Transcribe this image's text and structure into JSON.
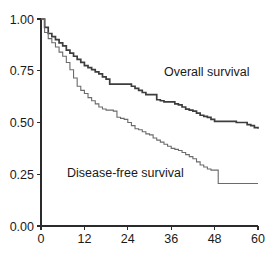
{
  "figure": {
    "background_color": "#ffffff",
    "axis_color": "#2b2b2b",
    "text_color": "#1a1a1a"
  },
  "annotations": {
    "overall_label": "Overall survival",
    "disease_free_label": "Disease-free survival"
  },
  "chart_data": {
    "type": "line",
    "title": "",
    "xlabel": "",
    "ylabel": "",
    "xlim": [
      0,
      60
    ],
    "ylim": [
      0,
      1.0
    ],
    "grid": false,
    "legend": "inline-annotations",
    "xticks": [
      0,
      12,
      24,
      36,
      48,
      60
    ],
    "xticklabels": [
      "0",
      "12",
      "24",
      "36",
      "48",
      "60"
    ],
    "yticks": [
      0.0,
      0.25,
      0.5,
      0.75,
      1.0
    ],
    "yticklabels": [
      "0.00",
      "0.25",
      "0.50",
      "0.75",
      "1.00"
    ],
    "series": [
      {
        "name": "Overall survival",
        "color": "#3d3d3d",
        "width": 1.7,
        "step": "post",
        "x": [
          0,
          1,
          2,
          3,
          4,
          5,
          6,
          7,
          8,
          9,
          10,
          11,
          12,
          13,
          14,
          15,
          16,
          17,
          18,
          19,
          20,
          21,
          24,
          25,
          26,
          27,
          28,
          29,
          30,
          31,
          32,
          33,
          34,
          35,
          36,
          37,
          38,
          39,
          40,
          41,
          42,
          43,
          44,
          45,
          46,
          47,
          48,
          50,
          52,
          54,
          56,
          57,
          58,
          59,
          60
        ],
        "y": [
          1.0,
          0.96,
          0.93,
          0.915,
          0.9,
          0.885,
          0.87,
          0.85,
          0.835,
          0.82,
          0.805,
          0.79,
          0.775,
          0.765,
          0.755,
          0.745,
          0.735,
          0.72,
          0.71,
          0.685,
          0.685,
          0.685,
          0.685,
          0.675,
          0.665,
          0.655,
          0.645,
          0.635,
          0.635,
          0.635,
          0.61,
          0.605,
          0.6,
          0.6,
          0.6,
          0.59,
          0.585,
          0.575,
          0.565,
          0.56,
          0.555,
          0.545,
          0.535,
          0.53,
          0.525,
          0.515,
          0.505,
          0.505,
          0.505,
          0.5,
          0.5,
          0.49,
          0.485,
          0.475,
          0.47
        ]
      },
      {
        "name": "Disease-free survival",
        "color": "#6b6b6b",
        "width": 1.1,
        "step": "post",
        "x": [
          0,
          1,
          2,
          3,
          4,
          5,
          6,
          7,
          8,
          9,
          10,
          11,
          12,
          13,
          14,
          15,
          16,
          17,
          18,
          19,
          20,
          21,
          22,
          23,
          24,
          25,
          26,
          27,
          28,
          29,
          30,
          31,
          32,
          33,
          34,
          35,
          36,
          37,
          38,
          39,
          40,
          41,
          42,
          43,
          44,
          45,
          46,
          47,
          48,
          49,
          52,
          56,
          60
        ],
        "y": [
          1.0,
          0.935,
          0.905,
          0.885,
          0.865,
          0.84,
          0.82,
          0.79,
          0.755,
          0.715,
          0.675,
          0.655,
          0.64,
          0.62,
          0.605,
          0.59,
          0.575,
          0.565,
          0.56,
          0.56,
          0.555,
          0.525,
          0.52,
          0.515,
          0.5,
          0.485,
          0.47,
          0.465,
          0.455,
          0.445,
          0.44,
          0.425,
          0.415,
          0.405,
          0.395,
          0.385,
          0.375,
          0.37,
          0.365,
          0.355,
          0.345,
          0.335,
          0.325,
          0.31,
          0.295,
          0.285,
          0.275,
          0.27,
          0.27,
          0.205,
          0.205,
          0.205,
          0.205
        ]
      }
    ]
  },
  "plot_geometry": {
    "x0_px": 41,
    "x1_px": 258,
    "y_top_px": 19,
    "y_bottom_px": 226
  }
}
